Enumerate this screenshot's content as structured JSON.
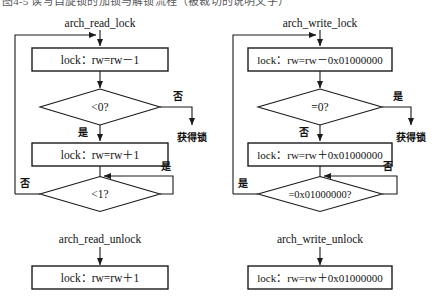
{
  "page": {
    "top_caption_fragment": "图4-5 读写自旋锁的加锁与解锁流程（被裁切的说明文字）",
    "width": 443,
    "height": 306,
    "background": "#ffffff",
    "ink": "#1a1a1a"
  },
  "labels": {
    "yes": "是",
    "no": "否",
    "acquired_lock": "获得锁"
  },
  "left_flow": {
    "title": "arch_read_lock",
    "nodes": [
      {
        "id": "read-lock-dec",
        "kind": "process",
        "text": "lock：rw=rw－1"
      },
      {
        "id": "read-lock-test-neg",
        "kind": "decision",
        "text": "<0?"
      },
      {
        "id": "read-lock-inc",
        "kind": "process",
        "text": "lock：rw=rw＋1"
      },
      {
        "id": "read-lock-spin-test",
        "kind": "decision",
        "text": "<1?"
      }
    ],
    "edges": [
      {
        "from": "entry",
        "to": "read-lock-dec",
        "label": ""
      },
      {
        "from": "read-lock-dec",
        "to": "read-lock-test-neg",
        "label": ""
      },
      {
        "from": "read-lock-test-neg",
        "to": "acquired",
        "label": "否"
      },
      {
        "from": "read-lock-test-neg",
        "to": "read-lock-inc",
        "label": "是"
      },
      {
        "from": "read-lock-inc",
        "to": "read-lock-spin-test",
        "label": ""
      },
      {
        "from": "read-lock-spin-test",
        "to": "read-lock-spin-test",
        "label": "是"
      },
      {
        "from": "read-lock-spin-test",
        "to": "read-lock-dec",
        "label": "否"
      }
    ],
    "terminal": "获得锁"
  },
  "right_flow": {
    "title": "arch_write_lock",
    "nodes": [
      {
        "id": "write-lock-sub",
        "kind": "process",
        "text": "lock：rw=rw－0x01000000"
      },
      {
        "id": "write-lock-test-zero",
        "kind": "decision",
        "text": "=0?"
      },
      {
        "id": "write-lock-add",
        "kind": "process",
        "text": "lock：rw=rw＋0x01000000"
      },
      {
        "id": "write-lock-spin-test",
        "kind": "decision",
        "text": "=0x01000000?"
      }
    ],
    "edges": [
      {
        "from": "entry",
        "to": "write-lock-sub",
        "label": ""
      },
      {
        "from": "write-lock-sub",
        "to": "write-lock-test-zero",
        "label": ""
      },
      {
        "from": "write-lock-test-zero",
        "to": "acquired",
        "label": "是"
      },
      {
        "from": "write-lock-test-zero",
        "to": "write-lock-add",
        "label": "否"
      },
      {
        "from": "write-lock-add",
        "to": "write-lock-spin-test",
        "label": ""
      },
      {
        "from": "write-lock-spin-test",
        "to": "write-lock-spin-test",
        "label": "否"
      },
      {
        "from": "write-lock-spin-test",
        "to": "write-lock-sub",
        "label": "是"
      }
    ],
    "terminal": "获得锁"
  },
  "left_unlock": {
    "title": "arch_read_unlock",
    "node": {
      "id": "read-unlock-inc",
      "kind": "process",
      "text": "lock：rw=rw＋1"
    }
  },
  "right_unlock": {
    "title": "arch_write_unlock",
    "node": {
      "id": "write-unlock-add",
      "kind": "process",
      "text": "lock：rw=rw＋0x01000000"
    }
  }
}
